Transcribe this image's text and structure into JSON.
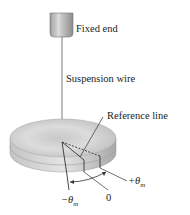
{
  "diagram": {
    "type": "torsion-pendulum",
    "labels": {
      "fixed_end": "Fixed end",
      "suspension_wire": "Suspension wire",
      "reference_line": "Reference line",
      "plus_theta": "+θ",
      "plus_theta_sub": "m",
      "zero": "0",
      "minus_theta": "−θ",
      "minus_theta_sub": "m"
    },
    "colors": {
      "metal_light": "#e6e6e6",
      "metal_mid": "#bdbdbd",
      "metal_dark": "#8a8a8a",
      "line": "#333333"
    }
  }
}
